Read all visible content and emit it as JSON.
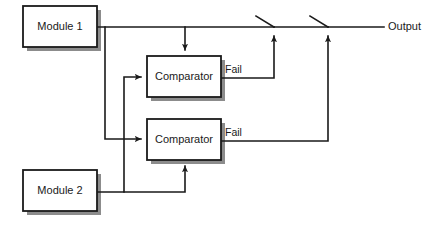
{
  "diagram": {
    "colors": {
      "background": "#ffffff",
      "line": "#1a1a1a",
      "box_fill": "#ffffff",
      "box_stroke": "#1a1a1a",
      "shadow": "#8c8c8c",
      "text": "#1a1a1a"
    },
    "blocks": [
      {
        "id": "module1",
        "label": "Module 1",
        "x": 23,
        "y": 6,
        "w": 74,
        "h": 41
      },
      {
        "id": "comparator1",
        "label": "Comparator",
        "x": 147,
        "y": 56,
        "w": 74,
        "h": 41
      },
      {
        "id": "comparator2",
        "label": "Comparator",
        "x": 147,
        "y": 119,
        "w": 74,
        "h": 41
      },
      {
        "id": "module2",
        "label": "Module 2",
        "x": 23,
        "y": 170,
        "w": 74,
        "h": 41
      }
    ],
    "wire_labels": [
      {
        "id": "fail1",
        "label": "Fail",
        "x": 225,
        "y": 70
      },
      {
        "id": "fail2",
        "label": "Fail",
        "x": 225,
        "y": 133
      }
    ],
    "terminals": [
      {
        "id": "output",
        "label": "Output",
        "x": 388,
        "y": 27
      }
    ],
    "switches": [
      {
        "id": "switch1",
        "pivot_x": 274,
        "pivot_y": 27,
        "tip_x": 256,
        "tip_y": 16
      },
      {
        "id": "switch2",
        "pivot_x": 328,
        "pivot_y": 27,
        "tip_x": 310,
        "tip_y": 16
      }
    ],
    "signal_paths": [
      {
        "id": "module1-to-bus",
        "from": "module1",
        "to": "output-bus",
        "y": 27
      },
      {
        "id": "module1-to-comparator1",
        "from": "module1",
        "to": "comparator1-top"
      },
      {
        "id": "module1-to-comparator2",
        "from": "module1",
        "to": "comparator2-left"
      },
      {
        "id": "module2-to-comparator1",
        "from": "module2",
        "to": "comparator1-left"
      },
      {
        "id": "module2-to-comparator2",
        "from": "module2",
        "to": "comparator2-bottom"
      },
      {
        "id": "fail1-to-switch1",
        "from": "comparator1",
        "to": "switch1"
      },
      {
        "id": "fail2-to-switch2",
        "from": "comparator2",
        "to": "switch2"
      }
    ]
  }
}
